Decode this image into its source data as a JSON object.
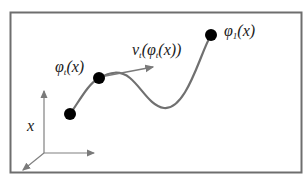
{
  "diagram": {
    "type": "flow-trajectory-illustration",
    "colors": {
      "frame": "#6e6e6e",
      "curve": "#707070",
      "axes": "#808080",
      "velocity_arrow": "#7a7a7a",
      "points": "#000000",
      "text": "#1a1a1a",
      "background": "#ffffff"
    },
    "labels": {
      "start_point": {
        "base": "x",
        "sub": "",
        "args": ""
      },
      "intermediate_point": {
        "base": "φ",
        "sub": "t",
        "args": "(x)"
      },
      "velocity": {
        "base": "v",
        "sub": "t",
        "args_open": "(",
        "inner_base": "φ",
        "inner_sub": "t",
        "args_close": "(x))"
      },
      "end_point": {
        "base": "φ",
        "sub": "1",
        "args": "(x)"
      }
    },
    "points": [
      {
        "name": "x",
        "cx": 70,
        "cy": 114
      },
      {
        "name": "phi_t(x)",
        "cx": 99,
        "cy": 78
      },
      {
        "name": "phi_1(x)",
        "cx": 211,
        "cy": 35
      }
    ]
  }
}
